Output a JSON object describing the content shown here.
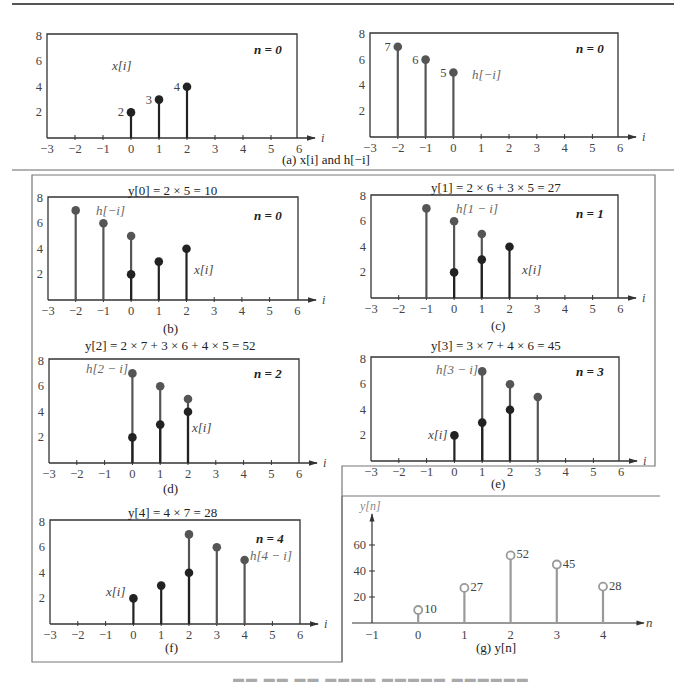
{
  "figure_caption": "Figure 7.12 Graphical convolution (partially cropped)",
  "panels": {
    "a": {
      "caption": "(a)  x[i] and h[−i]",
      "left": {
        "n_label": "n = 0",
        "seq_label": "x[i]"
      },
      "right": {
        "n_label": "n = 0",
        "seq_label": "h[−i]"
      }
    },
    "b": {
      "title": "y[0] = 2 × 5 = 10",
      "n_label": "n = 0",
      "h_label": "h[−i]",
      "x_label": "x[i]",
      "caption": "(b)"
    },
    "c": {
      "title": "y[1] = 2 × 6 + 3 × 5 = 27",
      "n_label": "n = 1",
      "h_label": "h[1 − i]",
      "x_label": "x[i]",
      "caption": "(c)"
    },
    "d": {
      "title": "y[2] = 2 × 7 + 3 × 6 + 4 × 5 = 52",
      "n_label": "n = 2",
      "h_label": "h[2 − i]",
      "x_label": "x[i]",
      "caption": "(d)"
    },
    "e": {
      "title": "y[3] = 3 × 7 + 4 × 6 = 45",
      "n_label": "n = 3",
      "h_label": "h[3 − i]",
      "x_label": "x[i]",
      "caption": "(e)"
    },
    "f": {
      "title": "y[4] = 4 × 7 = 28",
      "n_label": "n = 4",
      "h_label": "h[4 − i]",
      "x_label": "x[i]",
      "caption": "(f)"
    },
    "g": {
      "ylabel": "y[n]",
      "xlabel": "n",
      "caption": "(g)  y[n]"
    }
  },
  "axis": {
    "x_var": "i",
    "x_ticks": [
      "−3",
      "−2",
      "−1",
      "0",
      "1",
      "2",
      "3",
      "4",
      "5",
      "6"
    ],
    "y_ticks": [
      "2",
      "4",
      "6",
      "8"
    ]
  },
  "g_axis": {
    "x_ticks": [
      "−1",
      "0",
      "1",
      "2",
      "3",
      "4"
    ],
    "y_ticks": [
      "20",
      "40",
      "60"
    ]
  },
  "colors": {
    "x_stem": "#222222",
    "h_stem": "#555555",
    "y_stem": "#999999"
  },
  "chart_data": [
    {
      "type": "stem",
      "panel": "a-left",
      "series": [
        {
          "name": "x[i]",
          "x": [
            0,
            1,
            2
          ],
          "values": [
            2,
            3,
            4
          ]
        }
      ],
      "xlim": [
        -3,
        6
      ],
      "ylim": [
        0,
        8
      ],
      "annotation": "n = 0",
      "point_labels": [
        "2",
        "3",
        "4"
      ]
    },
    {
      "type": "stem",
      "panel": "a-right",
      "series": [
        {
          "name": "h[−i]",
          "x": [
            -2,
            -1,
            0
          ],
          "values": [
            7,
            6,
            5
          ]
        }
      ],
      "xlim": [
        -3,
        6
      ],
      "ylim": [
        0,
        8
      ],
      "annotation": "n = 0",
      "point_labels": [
        "7",
        "6",
        "5"
      ]
    },
    {
      "type": "stem",
      "panel": "b",
      "title": "y[0] = 2 × 5 = 10",
      "series": [
        {
          "name": "x[i]",
          "x": [
            0,
            1,
            2
          ],
          "values": [
            2,
            3,
            4
          ]
        },
        {
          "name": "h[−i]",
          "x": [
            -2,
            -1,
            0
          ],
          "values": [
            7,
            6,
            5
          ]
        }
      ],
      "xlim": [
        -3,
        6
      ],
      "ylim": [
        0,
        8
      ]
    },
    {
      "type": "stem",
      "panel": "c",
      "title": "y[1] = 2 × 6 + 3 × 5 = 27",
      "series": [
        {
          "name": "x[i]",
          "x": [
            0,
            1,
            2
          ],
          "values": [
            2,
            3,
            4
          ]
        },
        {
          "name": "h[1 − i]",
          "x": [
            -1,
            0,
            1
          ],
          "values": [
            7,
            6,
            5
          ]
        }
      ],
      "xlim": [
        -3,
        6
      ],
      "ylim": [
        0,
        8
      ]
    },
    {
      "type": "stem",
      "panel": "d",
      "title": "y[2] = 2 × 7 + 3 × 6 + 4 × 5 = 52",
      "series": [
        {
          "name": "x[i]",
          "x": [
            0,
            1,
            2
          ],
          "values": [
            2,
            3,
            4
          ]
        },
        {
          "name": "h[2 − i]",
          "x": [
            0,
            1,
            2
          ],
          "values": [
            7,
            6,
            5
          ]
        }
      ],
      "xlim": [
        -3,
        6
      ],
      "ylim": [
        0,
        8
      ]
    },
    {
      "type": "stem",
      "panel": "e",
      "title": "y[3] = 3 × 7 + 4 × 6 = 45",
      "series": [
        {
          "name": "x[i]",
          "x": [
            0,
            1,
            2
          ],
          "values": [
            2,
            3,
            4
          ]
        },
        {
          "name": "h[3 − i]",
          "x": [
            1,
            2,
            3
          ],
          "values": [
            7,
            6,
            5
          ]
        }
      ],
      "xlim": [
        -3,
        6
      ],
      "ylim": [
        0,
        8
      ]
    },
    {
      "type": "stem",
      "panel": "f",
      "title": "y[4] = 4 × 7 = 28",
      "series": [
        {
          "name": "x[i]",
          "x": [
            0,
            1,
            2
          ],
          "values": [
            2,
            3,
            4
          ]
        },
        {
          "name": "h[4 − i]",
          "x": [
            2,
            3,
            4
          ],
          "values": [
            7,
            6,
            5
          ]
        }
      ],
      "xlim": [
        -3,
        6
      ],
      "ylim": [
        0,
        8
      ]
    },
    {
      "type": "stem",
      "panel": "g",
      "title": "(g) y[n]",
      "xlabel": "n",
      "ylabel": "y[n]",
      "series": [
        {
          "name": "y[n]",
          "x": [
            0,
            1,
            2,
            3,
            4
          ],
          "values": [
            10,
            27,
            52,
            45,
            28
          ]
        }
      ],
      "xlim": [
        -1,
        4.7
      ],
      "ylim": [
        0,
        70
      ],
      "point_labels": [
        "10",
        "27",
        "52",
        "45",
        "28"
      ]
    }
  ]
}
